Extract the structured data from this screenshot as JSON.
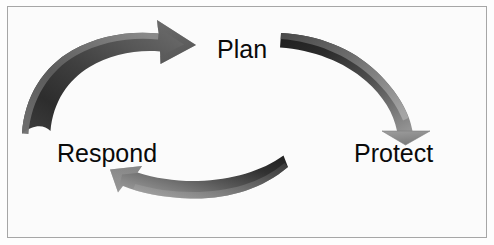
{
  "diagram": {
    "type": "cyclical-process",
    "background_color": "#fbfbfb",
    "border_color": "#a6a6a6",
    "label_color": "#0a0a0a",
    "nodes": [
      {
        "id": "plan",
        "label": "Plan",
        "position": "top-center"
      },
      {
        "id": "protect",
        "label": "Protect",
        "position": "right"
      },
      {
        "id": "respond",
        "label": "Respond",
        "position": "left"
      }
    ],
    "arrows": [
      {
        "id": "respond-to-plan",
        "from": "respond",
        "to": "plan",
        "direction": "up-right",
        "dark_color": "#2b2b2b",
        "mid_color": "#4a4a4a",
        "light_color": "#8e8e8e"
      },
      {
        "id": "plan-to-protect",
        "from": "plan",
        "to": "protect",
        "direction": "down-right",
        "dark_color": "#232323",
        "mid_color": "#555555",
        "light_color": "#9a9a9a"
      },
      {
        "id": "protect-to-respond",
        "from": "protect",
        "to": "respond",
        "direction": "left",
        "dark_color": "#242424",
        "mid_color": "#5d5d5d",
        "light_color": "#a3a3a3"
      }
    ]
  }
}
